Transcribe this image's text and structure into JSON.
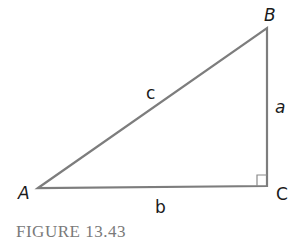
{
  "figure": {
    "caption": "FIGURE 13.43",
    "vertices": {
      "A": {
        "label": "A",
        "x": 38,
        "y": 188
      },
      "B": {
        "label": "B",
        "x": 267,
        "y": 28
      },
      "C": {
        "label": "C",
        "x": 267,
        "y": 186
      }
    },
    "sides": {
      "a": {
        "label": "a"
      },
      "b": {
        "label": "b"
      },
      "c": {
        "label": "c"
      }
    },
    "right_angle_at": "C",
    "colors": {
      "line": "#7d7d7d",
      "label": "#1a1a1a",
      "caption": "#7a7a7a"
    }
  }
}
